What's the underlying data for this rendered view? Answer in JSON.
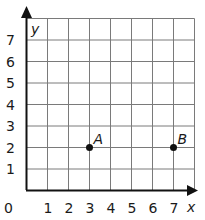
{
  "chart_data": {
    "type": "scatter",
    "title": "",
    "xlabel": "x",
    "ylabel": "y",
    "x_ticks": [
      "0",
      "1",
      "2",
      "3",
      "4",
      "5",
      "6",
      "7"
    ],
    "y_ticks": [
      "1",
      "2",
      "3",
      "4",
      "5",
      "6",
      "7"
    ],
    "xlim": [
      0,
      8
    ],
    "ylim": [
      0,
      8
    ],
    "grid": true,
    "points": [
      {
        "label": "A",
        "x": 3,
        "y": 2
      },
      {
        "label": "B",
        "x": 7,
        "y": 2
      }
    ]
  },
  "colors": {
    "grid": "#7a7a7a",
    "axis": "#111111",
    "point": "#111111",
    "text": "#1a1a1a"
  }
}
